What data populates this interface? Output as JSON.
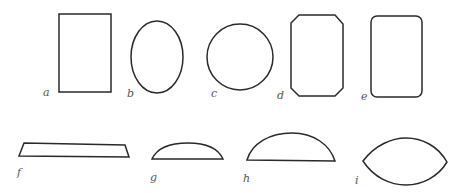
{
  "figure": {
    "shapes": [
      {
        "id": "a",
        "label": "a",
        "kind": "rectangle"
      },
      {
        "id": "b",
        "label": "b",
        "kind": "ellipse"
      },
      {
        "id": "c",
        "label": "c",
        "kind": "circle"
      },
      {
        "id": "d",
        "label": "d",
        "kind": "octagon-cut-corners"
      },
      {
        "id": "e",
        "label": "e",
        "kind": "rounded-rectangle"
      },
      {
        "id": "f",
        "label": "f",
        "kind": "trapezoid"
      },
      {
        "id": "g",
        "label": "g",
        "kind": "low-circular-segment"
      },
      {
        "id": "h",
        "label": "h",
        "kind": "high-circular-segment"
      },
      {
        "id": "i",
        "label": "i",
        "kind": "lens"
      }
    ],
    "colors": {
      "stroke": "#2a2a2a",
      "label": "#555555",
      "background": "#ffffff"
    }
  }
}
